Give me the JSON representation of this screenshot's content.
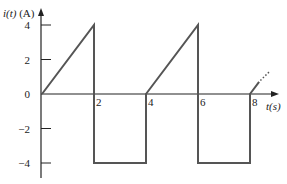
{
  "chart_data": {
    "type": "line",
    "title": "",
    "xlabel": "t(s)",
    "ylabel": "i(t) (A)",
    "xlim": [
      0,
      9
    ],
    "ylim": [
      -5,
      5
    ],
    "grid": false,
    "legend": null,
    "x_ticks": [
      2,
      4,
      6,
      8
    ],
    "x_tick_labels": [
      "2",
      "4",
      "6",
      "8"
    ],
    "y_ticks": [
      4,
      2,
      0,
      -2,
      -4
    ],
    "y_tick_labels": [
      "4",
      "2",
      "0",
      "−2",
      "−4"
    ],
    "series": [
      {
        "name": "i(t)",
        "description": "Periodic waveform, period 4 s: linear ramp 0→4 A over 0–2 s, drops to −4 A held constant over 2–4 s, returns to 0 and repeats",
        "x": [
          0,
          2,
          2,
          4,
          4,
          6,
          6,
          8,
          8,
          8.6
        ],
        "y": [
          0,
          4,
          -4,
          -4,
          0,
          4,
          -4,
          -4,
          0,
          1.2
        ]
      }
    ],
    "annotations": [
      "dotted continuation after t = 8 s indicating periodic repetition"
    ]
  },
  "axis": {
    "y_label_main": "i(t)",
    "y_label_unit": " (A)",
    "x_label": "t(s)"
  },
  "colors": {
    "axis": "#222222",
    "waveform": "#555555"
  }
}
